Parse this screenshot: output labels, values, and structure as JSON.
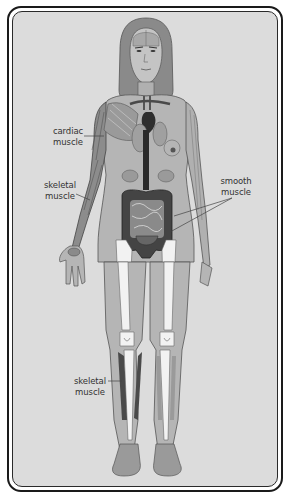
{
  "diagram": {
    "labels": {
      "cardiac": {
        "line1": "cardiac",
        "line2": "muscle"
      },
      "skeletal_arm": {
        "line1": "skeletal",
        "line2": "muscle"
      },
      "smooth": {
        "line1": "smooth",
        "line2": "muscle"
      },
      "skeletal_leg": {
        "line1": "skeletal",
        "line2": "muscle"
      }
    },
    "colors": {
      "background": "#dcdcdc",
      "skin": "#b5b5b5",
      "hair": "#8a8a8a",
      "bone": "#f2f2f2",
      "organ_dark": "#3a3a3a",
      "muscle": "#7a7a7a",
      "frame": "#1a1a1a"
    }
  }
}
